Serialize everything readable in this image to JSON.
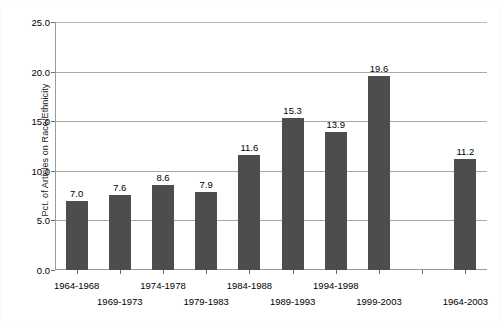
{
  "chart_data": {
    "type": "bar",
    "title": "",
    "xlabel": "",
    "ylabel": "Pct. of Articles on Race/Ethnicity",
    "categories": [
      "1964-1968",
      "1969-1973",
      "1974-1978",
      "1979-1983",
      "1984-1988",
      "1989-1993",
      "1994-1998",
      "1999-2003",
      "",
      "1964-2003"
    ],
    "values": [
      7.0,
      7.6,
      8.6,
      7.9,
      11.6,
      15.3,
      13.9,
      19.6,
      null,
      11.2
    ],
    "value_labels": [
      "7.0",
      "7.6",
      "8.6",
      "7.9",
      "11.6",
      "15.3",
      "13.9",
      "19.6",
      "",
      "11.2"
    ],
    "ylim": [
      0.0,
      25.0
    ],
    "yticks": [
      0.0,
      5.0,
      10.0,
      15.0,
      20.0,
      25.0
    ],
    "ytick_labels": [
      "0.0",
      "5.0",
      "10.0",
      "15.0",
      "20.0",
      "25.0"
    ],
    "grid": true,
    "legend": false,
    "bar_color": "#4d4d4d",
    "gridline_color": "#a8a8a8",
    "axis_color": "#9a9a9a"
  }
}
